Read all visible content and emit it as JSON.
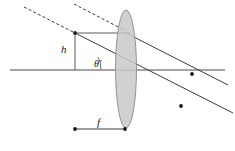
{
  "figure": {
    "background_color": "#ffffff",
    "width": 235,
    "height": 151
  },
  "labels": {
    "height_symbol": "h",
    "focal_symbol": "f",
    "angle_symbol": "θ'"
  },
  "colors": {
    "lens_fill": "#c9c9c9",
    "lens_stroke": "#8a8a8a",
    "ray_stroke": "#3c3c3c",
    "axis_stroke": "#4a4a4a",
    "dot_fill": "#1a1a1a"
  },
  "geometry": {
    "optical_axis": {
      "x1": 10,
      "y1": 70,
      "x2": 225,
      "y2": 70
    },
    "lens": {
      "cx": 126,
      "cy": 69,
      "rx": 10.5,
      "ry": 59
    },
    "object_point": {
      "x": 75,
      "y": 33
    },
    "height_line": {
      "x1": 75,
      "y1": 33,
      "x2": 75,
      "y2": 70
    },
    "top_ray_segment": {
      "x1": 75,
      "y1": 33,
      "x2": 126,
      "y2": 33
    },
    "focal_measure": {
      "x1": 75,
      "y1": 129,
      "x2": 125,
      "y2": 129
    },
    "angle_vertex": {
      "x": 75,
      "y": 70
    },
    "angle_arc_radius": 26,
    "angle_label_pos": {
      "x": 94,
      "y": 66
    },
    "height_label_pos": {
      "x": 61,
      "y": 53
    },
    "focal_label_pos": {
      "x": 97,
      "y": 126
    }
  },
  "rays": {
    "incident_dashed": [
      {
        "name": "dashed-ray-upper",
        "x1": 24,
        "y1": 7,
        "x2": 75,
        "y2": 33
      },
      {
        "name": "dashed-ray-lower",
        "x1": 74,
        "y1": 4,
        "x2": 126,
        "y2": 31
      }
    ],
    "solid_rays": [
      {
        "name": "chief-ray",
        "x1": 75,
        "y1": 33,
        "x2": 231,
        "y2": 112
      },
      {
        "name": "parallel-ray-refracted",
        "x1": 126,
        "y1": 33,
        "x2": 225,
        "y2": 83
      },
      {
        "name": "parallel-ray-incident",
        "x1": 75,
        "y1": 33,
        "x2": 126,
        "y2": 33
      }
    ],
    "arrow_dots": [
      {
        "name": "ray-direction-dot-upper",
        "x": 192,
        "y": 74
      },
      {
        "name": "ray-direction-dot-lower",
        "x": 181,
        "y": 106
      }
    ],
    "endpoint_dots": [
      {
        "name": "object-point-dot",
        "x": 75,
        "y": 33
      },
      {
        "name": "focal-left-dot",
        "x": 75,
        "y": 129
      },
      {
        "name": "focal-right-dot",
        "x": 125,
        "y": 129
      }
    ]
  }
}
